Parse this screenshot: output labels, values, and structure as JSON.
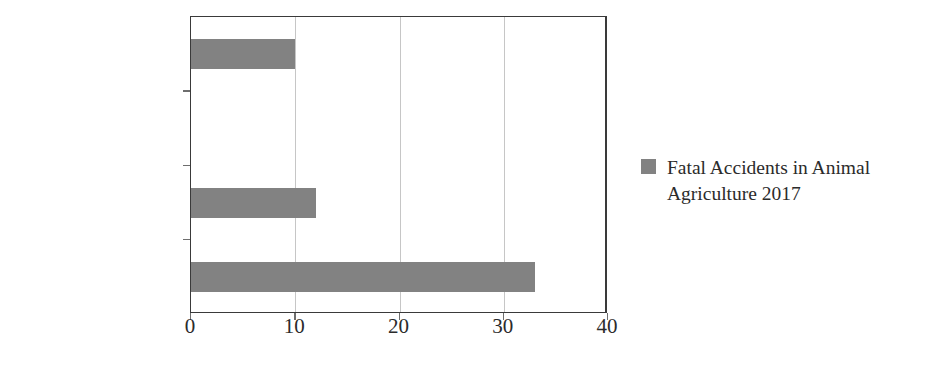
{
  "chart_data": {
    "type": "bar",
    "orientation": "horizontal",
    "title": "",
    "xlabel": "",
    "ylabel": "",
    "categories": [
      "Equine (Horses)",
      "Swine",
      "Poultry",
      "Dairy"
    ],
    "values": [
      10,
      0,
      12,
      33
    ],
    "series": [
      {
        "name": "Fatal Accidents in Animal Agriculture 2017",
        "color": "#828282",
        "values": [
          10,
          0,
          12,
          33
        ]
      }
    ],
    "xlim": [
      0,
      40
    ],
    "xticks": [
      0,
      10,
      20,
      30,
      40
    ],
    "xtick_labels": [
      "0",
      "10",
      "20",
      "30",
      "40"
    ],
    "grid": "vertical",
    "legend_position": "right"
  },
  "legend": {
    "entries": [
      {
        "label": "Fatal Accidents in Animal Agriculture 2017",
        "color": "#828282"
      }
    ]
  },
  "colors": {
    "bar": "#828282",
    "gridline": "#c6c6c6",
    "axis": "#3a3a3a",
    "tick": "#6e6e6e",
    "text": "#2b2b2b",
    "background": "#ffffff"
  }
}
